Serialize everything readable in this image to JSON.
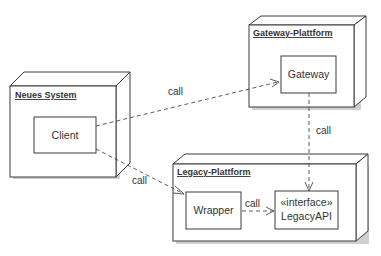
{
  "diagram": {
    "type": "uml-deployment",
    "nodes": [
      {
        "id": "neues-system",
        "title": "Neues System"
      },
      {
        "id": "gateway-plattform",
        "title": "Gateway-Plattform"
      },
      {
        "id": "legacy-plattform",
        "title": "Legacy-Plattform"
      }
    ],
    "components": [
      {
        "id": "client",
        "label": "Client",
        "node": "neues-system"
      },
      {
        "id": "gateway",
        "label": "Gateway",
        "node": "gateway-plattform"
      },
      {
        "id": "wrapper",
        "label": "Wrapper",
        "node": "legacy-plattform"
      },
      {
        "id": "legacyapi",
        "stereotype": "«interface»",
        "label": "LegacyAPI",
        "node": "legacy-plattform"
      }
    ],
    "edges": [
      {
        "from": "client",
        "to": "gateway",
        "label": "call"
      },
      {
        "from": "client",
        "to": "wrapper",
        "label": "call"
      },
      {
        "from": "gateway",
        "to": "legacyapi",
        "label": "call"
      },
      {
        "from": "wrapper",
        "to": "legacyapi",
        "label": "call"
      }
    ]
  }
}
